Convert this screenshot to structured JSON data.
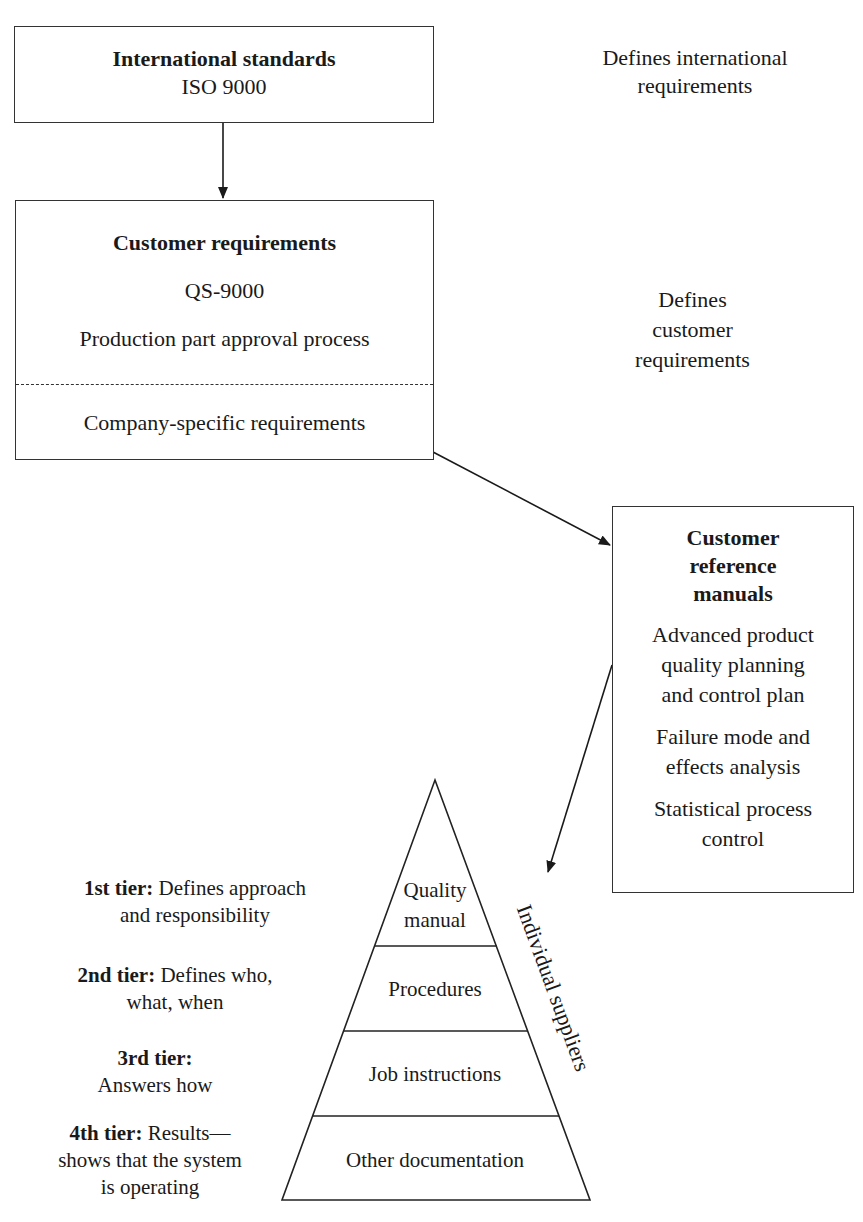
{
  "top_box": {
    "title": "International standards",
    "subtitle": "ISO 9000"
  },
  "top_note": {
    "line1": "Defines international",
    "line2": "requirements"
  },
  "customer_box": {
    "title": "Customer requirements",
    "item1": "QS-9000",
    "item2": "Production part approval process",
    "item3": "Company-specific requirements"
  },
  "customer_note": {
    "line1": "Defines",
    "line2": "customer",
    "line3": "requirements"
  },
  "manuals_box": {
    "title_line1": "Customer",
    "title_line2": "reference",
    "title_line3": "manuals",
    "apqp_line1": "Advanced product",
    "apqp_line2": "quality planning",
    "apqp_line3": "and control plan",
    "fmea_line1": "Failure mode and",
    "fmea_line2": "effects analysis",
    "spc_line1": "Statistical process",
    "spc_line2": "control"
  },
  "pyramid": {
    "level1_line1": "Quality",
    "level1_line2": "manual",
    "level2": "Procedures",
    "level3": "Job instructions",
    "level4": "Other documentation",
    "side_label": "Individual suppliers"
  },
  "tiers": [
    {
      "label": "1st tier:",
      "line1": "Defines approach",
      "line2": "and responsibility"
    },
    {
      "label": "2nd tier:",
      "line1": "Defines who,",
      "line2": "what, when"
    },
    {
      "label": "3rd tier:",
      "line1": "",
      "line2": "Answers how"
    },
    {
      "label": "4th tier:",
      "line1": "Results—",
      "line2": "shows that the system",
      "line3": "is operating"
    }
  ],
  "colors": {
    "line": "#333333",
    "text": "#1a1a1a",
    "background": "#ffffff"
  }
}
